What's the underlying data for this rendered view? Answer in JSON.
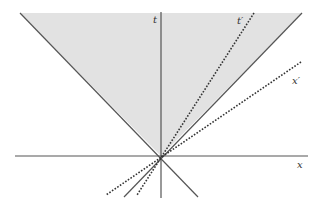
{
  "diagram": {
    "colors": {
      "shade": "#e2e2e2",
      "line": "#555555",
      "dotted": "#333333"
    },
    "labels": {
      "t_axis": "t",
      "x_axis": "x",
      "t_prime_axis": "t′",
      "x_prime_axis": "x′"
    },
    "elements": [
      {
        "name": "future-light-cone",
        "type": "shaded-region"
      },
      {
        "name": "t-axis",
        "type": "solid-line"
      },
      {
        "name": "x-axis",
        "type": "solid-line"
      },
      {
        "name": "light-line-left",
        "type": "solid-line"
      },
      {
        "name": "light-line-right",
        "type": "solid-line"
      },
      {
        "name": "t-prime-axis",
        "type": "dotted-line"
      },
      {
        "name": "x-prime-axis",
        "type": "dotted-line"
      }
    ]
  }
}
